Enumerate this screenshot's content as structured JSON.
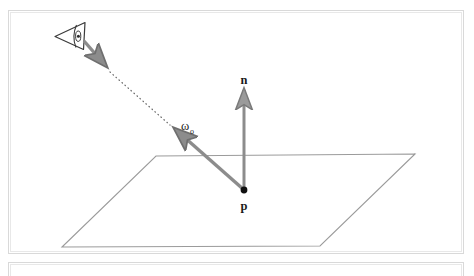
{
  "figure": {
    "background_color": "#ffffff",
    "frame_color": "#d9d9d9",
    "geometry_color": "#808080",
    "accent_color": "#8c8c8c",
    "label_color": "#1a1a1a",
    "width": 474,
    "height": 274
  },
  "labels": {
    "normal": "n",
    "point": "p",
    "omega_base": "ω",
    "omega_sub": "o"
  },
  "elements": {
    "eye_icon_name": "viewer-eye-icon",
    "plane_name": "surface-plane",
    "normal_arrow_name": "normal-vector-arrow",
    "omega_arrow_name": "outgoing-direction-arrow",
    "view_ray_name": "view-ray-dotted-line",
    "eye_ray_name": "eye-ray-arrow",
    "point_marker_name": "surface-point-marker"
  },
  "geometry": {
    "plane_polygon": "156,156 415,154 320,246 62,247",
    "point_p": {
      "x": 244,
      "y": 190
    },
    "normal_tip": {
      "x": 244,
      "y": 86
    },
    "omega_tip": {
      "x": 174,
      "y": 128
    },
    "eye_center": {
      "x": 68,
      "y": 36
    },
    "eye_ray_start": {
      "x": 81,
      "y": 42
    },
    "eye_ray_end": {
      "x": 108,
      "y": 70
    },
    "dotted_start": {
      "x": 110,
      "y": 71
    },
    "dotted_end": {
      "x": 170,
      "y": 126
    }
  }
}
